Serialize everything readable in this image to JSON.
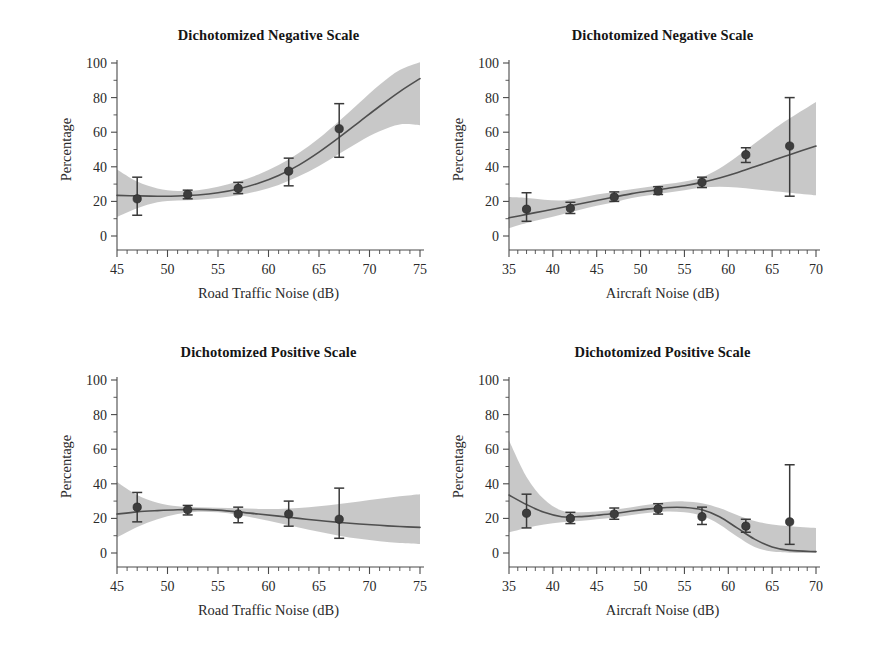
{
  "figure": {
    "background_color": "#ffffff",
    "band_color": "#c6c6c6",
    "line_color": "#4f4f4f",
    "marker_color": "#3d3d3d",
    "axis_color": "#4a4a4a"
  },
  "chart_data": [
    {
      "id": "top-left",
      "type": "line",
      "title": "Dichotomized Negative Scale",
      "xlabel": "Road Traffic Noise (dB)",
      "ylabel": "Percentage",
      "xlim": [
        45,
        75
      ],
      "ylim": [
        0,
        100
      ],
      "xticks": [
        45,
        50,
        55,
        60,
        65,
        70,
        75
      ],
      "yticks": [
        0,
        20,
        40,
        60,
        80,
        100
      ],
      "minor_tick_step": 1,
      "grid": false,
      "legend": "none",
      "series": [
        {
          "name": "Observed percentage",
          "x": [
            47,
            52,
            57,
            62,
            67
          ],
          "values": [
            21.5,
            24.0,
            27.5,
            37.5,
            62.0
          ],
          "err_low": [
            12.0,
            21.5,
            24.5,
            29.0,
            45.5
          ],
          "err_high": [
            34.0,
            26.5,
            31.0,
            45.0,
            76.5
          ]
        },
        {
          "name": "Fitted curve",
          "x": [
            45,
            47,
            49,
            51,
            53,
            55,
            57,
            59,
            61,
            63,
            65,
            67,
            69,
            71,
            73,
            75
          ],
          "values": [
            23.5,
            23.2,
            23.0,
            23.1,
            23.7,
            25.0,
            27.2,
            30.5,
            35.0,
            41.0,
            48.5,
            57.0,
            66.0,
            75.0,
            83.5,
            91.0
          ]
        },
        {
          "name": "Confidence band upper",
          "x": [
            45,
            47,
            49,
            51,
            53,
            55,
            57,
            59,
            61,
            63,
            65,
            67,
            69,
            71,
            73,
            75
          ],
          "values": [
            38.5,
            31.5,
            27.5,
            26.0,
            26.5,
            28.5,
            31.5,
            35.5,
            41.0,
            48.0,
            56.5,
            66.5,
            77.0,
            87.5,
            96.0,
            100.5
          ]
        },
        {
          "name": "Confidence band lower",
          "x": [
            45,
            47,
            49,
            51,
            53,
            55,
            57,
            59,
            61,
            63,
            65,
            67,
            69,
            71,
            73,
            75
          ],
          "values": [
            11.0,
            16.0,
            19.5,
            20.5,
            21.0,
            22.0,
            23.5,
            26.0,
            29.5,
            34.5,
            40.5,
            47.5,
            54.5,
            60.5,
            64.5,
            64.0
          ]
        }
      ]
    },
    {
      "id": "top-right",
      "type": "line",
      "title": "Dichotomized Negative Scale",
      "xlabel": "Aircraft Noise (dB)",
      "ylabel": "Percentage",
      "xlim": [
        35,
        70
      ],
      "ylim": [
        0,
        100
      ],
      "xticks": [
        35,
        40,
        45,
        50,
        55,
        60,
        65,
        70
      ],
      "yticks": [
        0,
        20,
        40,
        60,
        80,
        100
      ],
      "minor_tick_step": 1,
      "grid": false,
      "legend": "none",
      "series": [
        {
          "name": "Observed percentage",
          "x": [
            37,
            42,
            47,
            52,
            57,
            62,
            67
          ],
          "values": [
            15.5,
            16.0,
            22.5,
            26.0,
            31.0,
            47.0,
            52.0
          ],
          "err_low": [
            8.5,
            13.0,
            20.0,
            24.0,
            28.0,
            42.5,
            23.0
          ],
          "err_high": [
            25.0,
            19.5,
            25.5,
            28.5,
            34.0,
            51.0,
            80.0
          ]
        },
        {
          "name": "Fitted curve",
          "x": [
            35,
            37,
            39,
            41,
            43,
            45,
            47,
            49,
            51,
            53,
            55,
            57,
            59,
            61,
            63,
            65,
            67,
            70
          ],
          "values": [
            10.5,
            12.5,
            14.5,
            16.5,
            18.5,
            20.5,
            22.5,
            24.5,
            26.0,
            27.5,
            29.0,
            31.0,
            33.5,
            36.5,
            40.0,
            43.5,
            47.0,
            52.0
          ]
        },
        {
          "name": "Confidence band upper",
          "x": [
            35,
            37,
            39,
            41,
            43,
            45,
            47,
            49,
            51,
            53,
            55,
            57,
            59,
            61,
            63,
            65,
            67,
            70
          ],
          "values": [
            22.5,
            22.0,
            21.0,
            20.5,
            22.0,
            24.0,
            25.5,
            27.0,
            28.5,
            30.0,
            31.5,
            34.0,
            39.0,
            46.0,
            53.5,
            61.0,
            68.0,
            77.5
          ]
        },
        {
          "name": "Confidence band lower",
          "x": [
            35,
            37,
            39,
            41,
            43,
            45,
            47,
            49,
            51,
            53,
            55,
            57,
            59,
            61,
            63,
            65,
            67,
            70
          ],
          "values": [
            4.5,
            7.5,
            10.0,
            12.5,
            15.0,
            17.5,
            19.5,
            22.0,
            23.5,
            25.0,
            26.5,
            28.0,
            28.5,
            28.0,
            27.0,
            26.0,
            25.0,
            23.5
          ]
        }
      ]
    },
    {
      "id": "bottom-left",
      "type": "line",
      "title": "Dichotomized Positive Scale",
      "xlabel": "Road Traffic Noise (dB)",
      "ylabel": "Percentage",
      "xlim": [
        45,
        75
      ],
      "ylim": [
        0,
        100
      ],
      "xticks": [
        45,
        50,
        55,
        60,
        65,
        70,
        75
      ],
      "yticks": [
        0,
        20,
        40,
        60,
        80,
        100
      ],
      "minor_tick_step": 1,
      "grid": false,
      "legend": "none",
      "series": [
        {
          "name": "Observed percentage",
          "x": [
            47,
            52,
            57,
            62,
            67
          ],
          "values": [
            26.5,
            25.0,
            22.5,
            22.5,
            19.5
          ],
          "err_low": [
            18.0,
            22.0,
            17.5,
            15.5,
            8.5
          ],
          "err_high": [
            35.0,
            27.5,
            26.5,
            30.0,
            37.5
          ]
        },
        {
          "name": "Fitted curve",
          "x": [
            45,
            47,
            49,
            51,
            53,
            55,
            57,
            59,
            61,
            63,
            65,
            67,
            69,
            71,
            73,
            75
          ],
          "values": [
            22.5,
            23.8,
            24.5,
            25.0,
            25.2,
            24.8,
            23.8,
            22.5,
            21.3,
            20.0,
            18.8,
            17.7,
            16.8,
            16.0,
            15.3,
            14.8
          ]
        },
        {
          "name": "Confidence band upper",
          "x": [
            45,
            47,
            49,
            51,
            53,
            55,
            57,
            59,
            61,
            63,
            65,
            67,
            69,
            71,
            73,
            75
          ],
          "values": [
            41.0,
            33.5,
            29.0,
            27.0,
            26.5,
            26.2,
            25.8,
            25.5,
            25.5,
            26.0,
            27.0,
            28.3,
            29.8,
            31.3,
            32.8,
            34.0
          ]
        },
        {
          "name": "Confidence band lower",
          "x": [
            45,
            47,
            49,
            51,
            53,
            55,
            57,
            59,
            61,
            63,
            65,
            67,
            69,
            71,
            73,
            75
          ],
          "values": [
            9.0,
            15.0,
            19.5,
            22.5,
            23.8,
            23.5,
            22.0,
            19.8,
            17.3,
            14.8,
            12.3,
            10.0,
            8.2,
            6.8,
            5.8,
            5.2
          ]
        }
      ]
    },
    {
      "id": "bottom-right",
      "type": "line",
      "title": "Dichotomized Positive Scale",
      "xlabel": "Aircraft Noise (dB)",
      "ylabel": "Percentage",
      "xlim": [
        35,
        70
      ],
      "ylim": [
        0,
        100
      ],
      "xticks": [
        35,
        40,
        45,
        50,
        55,
        60,
        65,
        70
      ],
      "yticks": [
        0,
        20,
        40,
        60,
        80,
        100
      ],
      "minor_tick_step": 1,
      "grid": false,
      "legend": "none",
      "series": [
        {
          "name": "Observed percentage",
          "x": [
            37,
            42,
            47,
            52,
            57,
            62,
            67
          ],
          "values": [
            23.0,
            20.0,
            22.5,
            25.5,
            21.0,
            15.5,
            18.0
          ],
          "err_low": [
            14.5,
            17.0,
            19.5,
            22.5,
            16.5,
            12.0,
            5.0
          ],
          "err_high": [
            34.0,
            23.5,
            26.0,
            28.5,
            26.5,
            19.5,
            51.0
          ]
        },
        {
          "name": "Fitted curve",
          "x": [
            35,
            37,
            39,
            41,
            43,
            45,
            47,
            49,
            51,
            53,
            55,
            57,
            59,
            61,
            63,
            65,
            67,
            70
          ],
          "values": [
            33.5,
            28.0,
            23.5,
            21.0,
            21.0,
            21.8,
            22.8,
            24.3,
            25.5,
            26.3,
            26.3,
            25.0,
            21.0,
            14.5,
            8.0,
            3.5,
            1.5,
            0.8
          ]
        },
        {
          "name": "Confidence band upper",
          "x": [
            35,
            37,
            39,
            41,
            43,
            45,
            47,
            49,
            51,
            53,
            55,
            57,
            59,
            61,
            63,
            65,
            67,
            70
          ],
          "values": [
            65.0,
            44.0,
            31.0,
            24.5,
            23.5,
            24.0,
            25.0,
            26.5,
            28.0,
            29.5,
            29.8,
            28.8,
            26.0,
            22.0,
            18.5,
            16.5,
            15.5,
            14.5
          ]
        },
        {
          "name": "Confidence band lower",
          "x": [
            35,
            37,
            39,
            41,
            43,
            45,
            47,
            49,
            51,
            53,
            55,
            57,
            59,
            61,
            63,
            65,
            67,
            70
          ],
          "values": [
            12.0,
            14.5,
            16.5,
            17.8,
            18.5,
            19.5,
            20.5,
            22.0,
            23.3,
            24.0,
            23.5,
            21.5,
            16.5,
            9.5,
            3.5,
            0.8,
            0.2,
            0.0
          ]
        }
      ]
    }
  ]
}
